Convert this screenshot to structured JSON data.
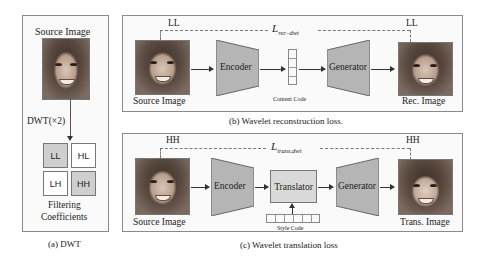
{
  "panel_a": {
    "title": "Source Image",
    "operation": "DWT(×2)",
    "coefficients": [
      "LL",
      "HL",
      "LH",
      "HH"
    ],
    "coefficients_label_line1": "Filtering",
    "coefficients_label_line2": "Coefficients",
    "caption": "(a) DWT"
  },
  "panel_b": {
    "band_left": "LL",
    "band_right": "LL",
    "loss_label": "L",
    "loss_subscript": "rec–dwt",
    "source_label": "Source Image",
    "encoder": "Encoder",
    "content_code": "Content Code",
    "generator": "Generator",
    "output_label": "Rec. Image",
    "caption": "(b) Wavelet reconstruction loss."
  },
  "panel_c": {
    "band_left": "HH",
    "band_right": "HH",
    "loss_label": "L",
    "loss_subscript": "trans.dwt",
    "source_label": "Source Image",
    "encoder": "Encoder",
    "translator": "Translator",
    "style_code": "Style Code",
    "generator": "Generator",
    "output_label": "Trans. Image",
    "caption": "(c) Wavelet translation loss"
  },
  "colors": {
    "module_fill": "#b5b5b5",
    "translator_fill": "#d9d9d9",
    "coef_shaded": "#cfcfcf",
    "panel_border": "#8a8a8a",
    "dashed": "#777777"
  }
}
